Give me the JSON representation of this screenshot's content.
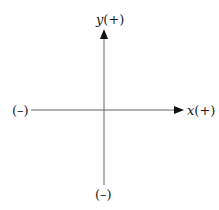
{
  "diagram": {
    "type": "coordinate-axes",
    "y_axis": {
      "positive_var": "y",
      "positive_sign": "(+)",
      "negative_label": "(–)"
    },
    "x_axis": {
      "positive_var": "x",
      "positive_sign": "(+)",
      "negative_label": "(–)"
    },
    "colors": {
      "axis": "#555555",
      "arrow": "#111111",
      "text": "#1a1a1a"
    }
  }
}
